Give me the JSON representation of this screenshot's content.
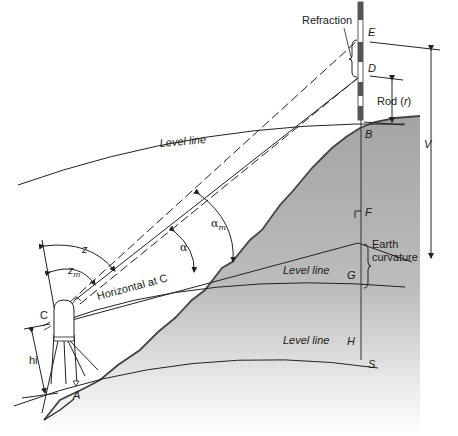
{
  "diagram": {
    "labels": {
      "refraction": "Refraction",
      "point_E": "E",
      "point_D": "D",
      "rod": "Rod (r)",
      "rod_prefix": "Rod (",
      "rod_var": "r",
      "rod_suffix": ")",
      "point_B": "B",
      "V": "V",
      "point_F": "F",
      "earth_curvature_1": "Earth",
      "earth_curvature_2": "curvature",
      "point_G": "G",
      "point_H": "H",
      "point_S": "S",
      "level_line_top": "Level line",
      "level_line_mid": "Level line",
      "level_line_bottom": "Level line",
      "horizontal_at_c": "Horizontal at C",
      "point_C": "C",
      "point_A": "A",
      "hi": "hi",
      "z": "z",
      "zm_base": "z",
      "zm_sub": "m",
      "alpha": "α",
      "alpha_m_base": "α",
      "alpha_m_sub": "m"
    },
    "colors": {
      "ground": "#a8a8a8",
      "ground_light": "#f4f4f4",
      "line": "#2a2a2a",
      "rod_dark": "#555555"
    }
  }
}
